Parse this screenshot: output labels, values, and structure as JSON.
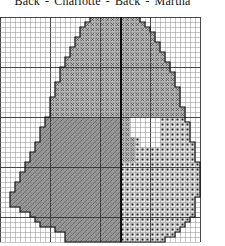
{
  "header": {
    "labels": [
      "Back",
      "Charlotte",
      "Back",
      "Martha"
    ]
  },
  "chart": {
    "cell_size": 5,
    "cols": 40,
    "rows": 45,
    "center_col": 24,
    "grid_color": "#8a8a8a",
    "grid_major_color": "#333333",
    "outline_color": "#111111",
    "fills": {
      "upper_x": "#b8b8b8",
      "lower_hatch": "#9c9c9c",
      "dots": "#e8e8e8",
      "hole": "#ffffff"
    },
    "left_upper_end_row": 19,
    "right_upper_end_row_inner": 28,
    "hole": {
      "row_start": 20,
      "row_end": 25,
      "col_start": 26,
      "col_end": 31
    },
    "row_spans": [
      [
        18,
        28
      ],
      [
        17,
        29
      ],
      [
        16,
        30
      ],
      [
        16,
        31
      ],
      [
        15,
        31
      ],
      [
        15,
        32
      ],
      [
        14,
        32
      ],
      [
        14,
        33
      ],
      [
        13,
        33
      ],
      [
        13,
        34
      ],
      [
        12,
        34
      ],
      [
        12,
        35
      ],
      [
        12,
        35
      ],
      [
        11,
        35
      ],
      [
        11,
        36
      ],
      [
        11,
        36
      ],
      [
        10,
        36
      ],
      [
        10,
        36
      ],
      [
        10,
        37
      ],
      [
        10,
        37
      ],
      [
        9,
        37
      ],
      [
        9,
        38
      ],
      [
        8,
        38
      ],
      [
        8,
        38
      ],
      [
        8,
        38
      ],
      [
        7,
        39
      ],
      [
        7,
        39
      ],
      [
        6,
        39
      ],
      [
        6,
        39
      ],
      [
        5,
        40
      ],
      [
        5,
        40
      ],
      [
        4,
        40
      ],
      [
        4,
        40
      ],
      [
        3,
        40
      ],
      [
        3,
        40
      ],
      [
        2,
        40
      ],
      [
        2,
        39
      ],
      [
        2,
        39
      ],
      [
        4,
        39
      ],
      [
        6,
        39
      ],
      [
        7,
        38
      ],
      [
        8,
        37
      ],
      [
        11,
        36
      ],
      [
        13,
        35
      ],
      [
        13,
        33
      ]
    ]
  }
}
